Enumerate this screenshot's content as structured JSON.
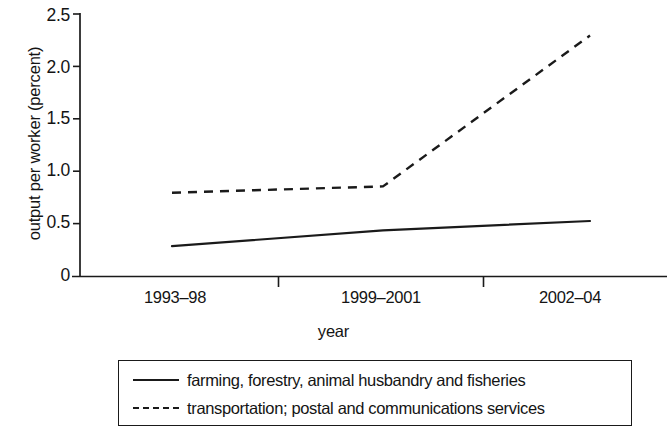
{
  "chart_data": {
    "type": "line",
    "title": "",
    "xlabel": "year",
    "ylabel": "output per worker (percent)",
    "categories": [
      "1993–98",
      "1999–2001",
      "2002–04"
    ],
    "xtick_labels": [
      "1993–98",
      "1999–2001",
      "2002–04"
    ],
    "ytick_labels": [
      "2.5",
      "2.0",
      "1.5",
      "1.0",
      "0.5",
      "0"
    ],
    "ytick_values": [
      2.5,
      2.0,
      1.5,
      1.0,
      0.5,
      0
    ],
    "ylim": [
      0,
      2.5
    ],
    "grid": false,
    "legend_position": "below-plot",
    "series": [
      {
        "name": "farming, forestry, animal husbandry and fisheries",
        "style": "solid",
        "color": "#1a1a1a",
        "values": [
          0.29,
          0.44,
          0.53
        ]
      },
      {
        "name": "transportation; postal and communications services",
        "style": "dashed",
        "color": "#1a1a1a",
        "values": [
          0.8,
          0.86,
          2.3
        ]
      }
    ]
  },
  "legend": {
    "entries": [
      {
        "label": "farming, forestry, animal husbandry and fisheries",
        "style": "solid"
      },
      {
        "label": "transportation; postal and communications services",
        "style": "dashed"
      }
    ]
  },
  "axes": {
    "y_title": "output per worker (percent)",
    "x_title": "year",
    "y_labels": [
      "2.5",
      "2.0",
      "1.5",
      "1.0",
      "0.5",
      "0"
    ],
    "x_labels": [
      "1993–98",
      "1999–2001",
      "2002–04"
    ]
  },
  "colors": {
    "ink": "#1a1a1a",
    "background": "#ffffff"
  }
}
